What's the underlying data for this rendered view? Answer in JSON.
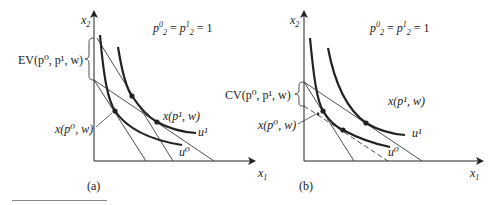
{
  "figure": {
    "panels": [
      {
        "id": "a",
        "caption": "(a)",
        "y_axis_label": "x",
        "y_axis_sub": "2",
        "x_axis_label": "x",
        "x_axis_sub": "1",
        "price_note": {
          "p": "p",
          "sup0": "0",
          "sub0": "2",
          "eq": " = ",
          "sup1": "1",
          "sub1": "2",
          "rhs": " = 1"
        },
        "brace_label": "EV(p⁰, p¹, w)",
        "point_labels": {
          "x_p0_w": "x(p⁰, w)",
          "x_p1_w": "x(p¹, w)"
        },
        "curve_labels": {
          "u0": "u⁰",
          "u1": "u¹"
        }
      },
      {
        "id": "b",
        "caption": "(b)",
        "y_axis_label": "x",
        "y_axis_sub": "2",
        "x_axis_label": "x",
        "x_axis_sub": "1",
        "price_note": {
          "p": "p",
          "sup0": "0",
          "sub0": "2",
          "eq": " = ",
          "sup1": "1",
          "sub1": "2",
          "rhs": " = 1"
        },
        "brace_label": "CV(p⁰, p¹, w)",
        "point_labels": {
          "x_p0_w": "x(p⁰, w)",
          "x_p1_w": "x(p¹, w)"
        },
        "curve_labels": {
          "u0": "u⁰",
          "u1": "u¹"
        }
      }
    ],
    "left_x_axis_label_between": "x",
    "left_x_axis_sub_between": "1"
  },
  "colors": {
    "line": "#222222",
    "footnote_rule": "#888888"
  }
}
